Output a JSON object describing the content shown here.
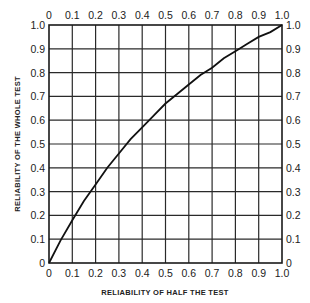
{
  "chart_data": {
    "type": "line",
    "title": "",
    "xlabel": "RELIABILITY OF HALF THE TEST",
    "ylabel": "RELIABILITY OF THE WHOLE TEST",
    "xlim": [
      0,
      1.0
    ],
    "ylim": [
      0,
      1.0
    ],
    "grid": true,
    "legend": null,
    "x_ticks": [
      "0",
      "0.1",
      "0.2",
      "0.3",
      "0.4",
      "0.5",
      "0.6",
      "0.7",
      "0.8",
      "0.9",
      "1.0"
    ],
    "y_ticks": [
      "0",
      "0.1",
      "0.2",
      "0.3",
      "0.4",
      "0.5",
      "0.6",
      "0.7",
      "0.8",
      "0.9",
      "1.0"
    ],
    "top_ticks": [
      "0",
      "0.1",
      "0.2",
      "0.3",
      "0.4",
      "0.5",
      "0.6",
      "0.7",
      "0.8",
      "0.9",
      "1.0"
    ],
    "right_ticks": [
      "0",
      "0.1",
      "0.2",
      "0.3",
      "0.4",
      "0.5",
      "0.6",
      "0.7",
      "0.8",
      "0.9",
      "1.0"
    ],
    "series": [
      {
        "name": "Whole-test reliability",
        "x": [
          0,
          0.05,
          0.1,
          0.15,
          0.2,
          0.25,
          0.3,
          0.35,
          0.4,
          0.45,
          0.5,
          0.55,
          0.6,
          0.65,
          0.7,
          0.75,
          0.8,
          0.85,
          0.9,
          0.95,
          1.0
        ],
        "y": [
          0,
          0.095,
          0.18,
          0.26,
          0.33,
          0.4,
          0.46,
          0.52,
          0.57,
          0.62,
          0.67,
          0.71,
          0.75,
          0.79,
          0.82,
          0.86,
          0.89,
          0.92,
          0.95,
          0.97,
          1.0
        ]
      }
    ]
  }
}
